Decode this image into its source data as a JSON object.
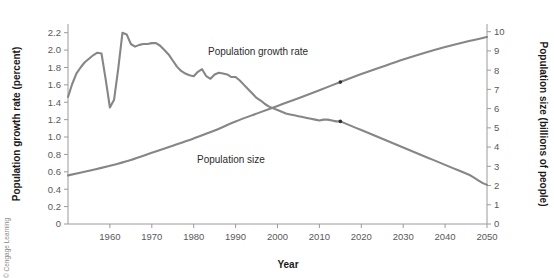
{
  "figure": {
    "credit": "© Cengage Learning"
  },
  "chart_data": {
    "type": "line",
    "title": "",
    "xlabel": "Year",
    "ylabel": "Population growth rate (percent)",
    "y2label": "Population size (billions of people)",
    "grid": false,
    "legend_position": "inline-annotation",
    "xlim": [
      1950,
      2050
    ],
    "ylim": [
      0,
      2.3
    ],
    "y2lim": [
      0,
      10.4
    ],
    "xticks": [
      1960,
      1970,
      1980,
      1990,
      2000,
      2010,
      2020,
      2030,
      2040,
      2050
    ],
    "xtick_labels": [
      "1960",
      "1970",
      "1980",
      "1990",
      "2000",
      "2010",
      "2020",
      "2030",
      "2040",
      "2050"
    ],
    "yticks": [
      0,
      0.2,
      0.4,
      0.6,
      0.8,
      1.0,
      1.2,
      1.4,
      1.6,
      1.8,
      2.0,
      2.2
    ],
    "ytick_labels": [
      "0",
      "0.2",
      "0.4",
      "0.6",
      "0.8",
      "1.0",
      "1.2",
      "1.4",
      "1.6",
      "1.8",
      "2.0",
      "2.2"
    ],
    "y2ticks": [
      0,
      1,
      2,
      3,
      4,
      5,
      6,
      7,
      8,
      9,
      10
    ],
    "y2tick_labels": [
      "0",
      "1",
      "2",
      "3",
      "4",
      "5",
      "6",
      "7",
      "8",
      "9",
      "10"
    ],
    "line_color": "#868686",
    "marker_color": "#2f2f2f",
    "series": [
      {
        "name": "Population growth rate",
        "axis": "left",
        "units": "percent",
        "label_text": "Population growth rate",
        "x": [
          1950,
          1951,
          1952,
          1953,
          1954,
          1955,
          1956,
          1957,
          1958,
          1959,
          1960,
          1961,
          1962,
          1963,
          1964,
          1965,
          1966,
          1967,
          1968,
          1969,
          1970,
          1971,
          1972,
          1973,
          1974,
          1975,
          1976,
          1977,
          1978,
          1979,
          1980,
          1981,
          1982,
          1983,
          1984,
          1985,
          1986,
          1987,
          1988,
          1989,
          1990,
          1991,
          1992,
          1993,
          1994,
          1995,
          1996,
          1997,
          1998,
          1999,
          2000,
          2001,
          2002,
          2003,
          2004,
          2005,
          2006,
          2007,
          2008,
          2009,
          2010,
          2011,
          2012,
          2013,
          2014,
          2015,
          2016,
          2017,
          2018,
          2019,
          2020,
          2021,
          2022,
          2023,
          2024,
          2025,
          2026,
          2027,
          2028,
          2029,
          2030,
          2031,
          2032,
          2033,
          2034,
          2035,
          2036,
          2037,
          2038,
          2039,
          2040,
          2041,
          2042,
          2043,
          2044,
          2045,
          2046,
          2047,
          2048,
          2049,
          2050
        ],
        "values": [
          1.46,
          1.61,
          1.73,
          1.8,
          1.86,
          1.9,
          1.94,
          1.97,
          1.96,
          1.66,
          1.34,
          1.43,
          1.79,
          2.2,
          2.18,
          2.07,
          2.04,
          2.06,
          2.07,
          2.07,
          2.08,
          2.08,
          2.05,
          2.0,
          1.95,
          1.88,
          1.81,
          1.76,
          1.73,
          1.71,
          1.7,
          1.75,
          1.78,
          1.7,
          1.67,
          1.72,
          1.74,
          1.73,
          1.72,
          1.69,
          1.69,
          1.65,
          1.6,
          1.55,
          1.5,
          1.45,
          1.42,
          1.38,
          1.35,
          1.33,
          1.31,
          1.29,
          1.27,
          1.26,
          1.25,
          1.24,
          1.23,
          1.22,
          1.21,
          1.2,
          1.19,
          1.2,
          1.2,
          1.19,
          1.18,
          1.18,
          1.16,
          1.14,
          1.12,
          1.1,
          1.08,
          1.06,
          1.04,
          1.02,
          1.0,
          0.98,
          0.96,
          0.94,
          0.92,
          0.9,
          0.88,
          0.86,
          0.84,
          0.82,
          0.8,
          0.78,
          0.76,
          0.74,
          0.72,
          0.7,
          0.68,
          0.66,
          0.64,
          0.62,
          0.6,
          0.58,
          0.56,
          0.53,
          0.5,
          0.47,
          0.45
        ],
        "marker_year": 2015,
        "marker_value": 1.18
      },
      {
        "name": "Population size",
        "axis": "right",
        "units": "billions of people",
        "label_text": "Population size",
        "x": [
          1950,
          1955,
          1960,
          1965,
          1970,
          1975,
          1980,
          1985,
          1990,
          1995,
          2000,
          2005,
          2010,
          2015,
          2020,
          2025,
          2030,
          2035,
          2040,
          2045,
          2050
        ],
        "values": [
          2.53,
          2.77,
          3.03,
          3.33,
          3.7,
          4.07,
          4.45,
          4.86,
          5.33,
          5.74,
          6.14,
          6.54,
          6.96,
          7.38,
          7.8,
          8.18,
          8.55,
          8.89,
          9.2,
          9.48,
          9.72
        ],
        "marker_year": 2015,
        "marker_value": 7.38
      }
    ]
  }
}
